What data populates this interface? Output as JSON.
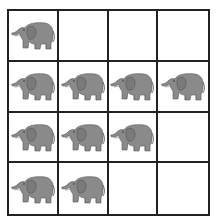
{
  "diagram": {
    "type": "grid",
    "rows": 4,
    "cols": 4,
    "item": "elephant-icon",
    "colors": {
      "grid_line": "#222222",
      "elephant_body": "#8a8a8a",
      "elephant_shade": "#6e6e6e",
      "tusk": "#f2f2f2",
      "background": "#ffffff"
    },
    "counts_per_row": [
      1,
      4,
      3,
      2
    ],
    "total": 10,
    "cells": [
      [
        true,
        false,
        false,
        false
      ],
      [
        true,
        true,
        true,
        true
      ],
      [
        true,
        true,
        true,
        false
      ],
      [
        true,
        true,
        false,
        false
      ]
    ]
  }
}
